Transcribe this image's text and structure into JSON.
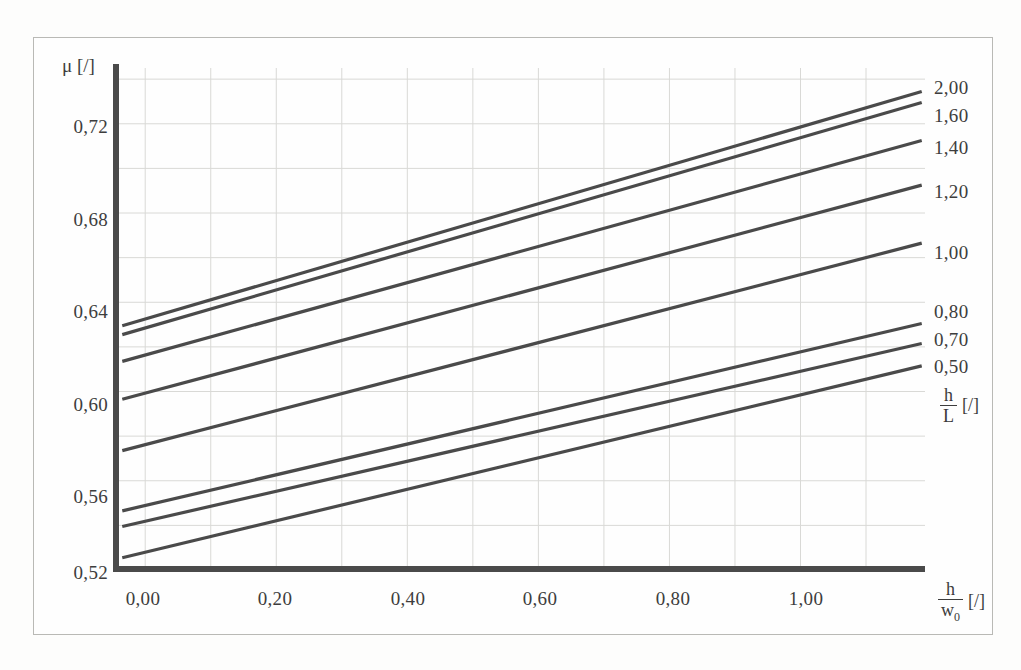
{
  "figure": {
    "y_axis_symbol": "μ",
    "y_axis_unit": "[/]",
    "x_axis_num": "h",
    "x_axis_den": "w",
    "x_axis_den_sub": "0",
    "x_axis_unit": "[/]",
    "legend_num": "h",
    "legend_den": "L",
    "legend_unit": "[/]"
  },
  "chart_data": {
    "type": "line",
    "title": "",
    "xlabel": "h / w0 [/]",
    "ylabel": "μ [/]",
    "xlim": [
      -0.04,
      1.19
    ],
    "ylim": [
      0.52,
      0.745
    ],
    "xticks": [
      0.0,
      0.2,
      0.4,
      0.6,
      0.8,
      1.0
    ],
    "xticklabels": [
      "0,00",
      "0,20",
      "0,40",
      "0,60",
      "0,80",
      "1,00"
    ],
    "yticks": [
      0.52,
      0.56,
      0.6,
      0.64,
      0.68,
      0.72
    ],
    "yticklabels": [
      "0,52",
      "0,56",
      "0,60",
      "0,64",
      "0,68",
      "0,72"
    ],
    "grid": true,
    "grid_color": "#d9d9d6",
    "line_color": "#4a4a4a",
    "legend_position": "right",
    "legend_title": "h / L [/]",
    "x_start": -0.035,
    "x_end": 1.185,
    "series": [
      {
        "name": "2,00",
        "y_start": 0.6295,
        "y_end": 0.7345
      },
      {
        "name": "1,60",
        "y_start": 0.6255,
        "y_end": 0.7295
      },
      {
        "name": "1,40",
        "y_start": 0.6135,
        "y_end": 0.7125
      },
      {
        "name": "1,20",
        "y_start": 0.5965,
        "y_end": 0.6925
      },
      {
        "name": "1,00",
        "y_start": 0.5735,
        "y_end": 0.6665
      },
      {
        "name": "0,80",
        "y_start": 0.5465,
        "y_end": 0.6305
      },
      {
        "name": "0,70",
        "y_start": 0.5395,
        "y_end": 0.6215
      },
      {
        "name": "0,50",
        "y_start": 0.5255,
        "y_end": 0.6115
      }
    ]
  },
  "legend_items": [
    {
      "label": "2,00",
      "top": 78
    },
    {
      "label": "1,60",
      "top": 106
    },
    {
      "label": "1,40",
      "top": 138
    },
    {
      "label": "1,20",
      "top": 182
    },
    {
      "label": "1,00",
      "top": 243
    },
    {
      "label": "0,80",
      "top": 302
    },
    {
      "label": "0,70",
      "top": 330
    },
    {
      "label": "0,50",
      "top": 357
    }
  ],
  "y_tick_positions": [
    {
      "label": "0,72",
      "top": 117
    },
    {
      "label": "0,68",
      "top": 210
    },
    {
      "label": "0,64",
      "top": 302
    },
    {
      "label": "0,60",
      "top": 395
    },
    {
      "label": "0,56",
      "top": 487
    },
    {
      "label": "0,52",
      "top": 563
    }
  ],
  "x_tick_positions": [
    {
      "label": "0,00",
      "left": 143
    },
    {
      "label": "0,20",
      "left": 275
    },
    {
      "label": "0,40",
      "left": 408
    },
    {
      "label": "0,60",
      "left": 540
    },
    {
      "label": "0,80",
      "left": 673
    },
    {
      "label": "1,00",
      "left": 806
    }
  ]
}
